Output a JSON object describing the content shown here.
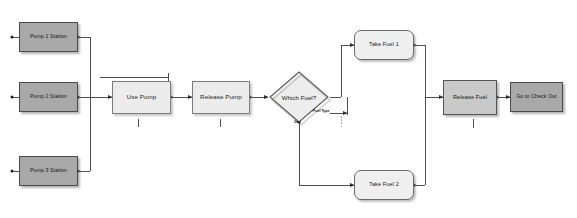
{
  "diagram": {
    "colors": {
      "dark_fill": "#a9a9a9",
      "light_fill": "#ececec",
      "med_fill": "#c9c9c9",
      "round_fill": "#efefef",
      "stroke": "#4a4a4a",
      "wire": "#3c3c3c",
      "background": "#ffffff"
    },
    "nodes": {
      "pump1": {
        "label": "Pump 1 Station",
        "shape": "rectangle"
      },
      "pump2": {
        "label": "Pump 2 Station",
        "shape": "rectangle"
      },
      "pump3": {
        "label": "Pump 3 Station",
        "shape": "rectangle"
      },
      "use_pump": {
        "label": "Use Pump",
        "shape": "rectangle"
      },
      "release_pump": {
        "label": "Release Pump",
        "shape": "rectangle"
      },
      "which_fuel": {
        "label": "Which Fuel?",
        "shape": "diamond"
      },
      "take_fuel_1": {
        "label": "Take Fuel 1",
        "shape": "rounded-rectangle"
      },
      "take_fuel_2": {
        "label": "Take Fuel 2",
        "shape": "rounded-rectangle"
      },
      "release_fuel": {
        "label": "Release Fuel",
        "shape": "rectangle"
      },
      "check_out": {
        "label": "Go to Check Out",
        "shape": "rectangle"
      }
    },
    "edge_labels": {
      "fuel_type": "Fuel Type",
      "gas": "Gas"
    }
  }
}
